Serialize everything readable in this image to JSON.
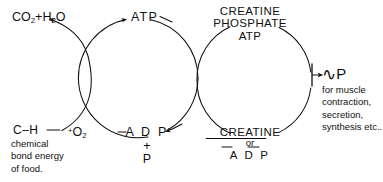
{
  "diagram": {
    "type": "hand-drawn cycle diagram",
    "ink_color": "#101010",
    "background_color": "#ffffff",
    "labels": {
      "waste_products": {
        "formula_1": "CO",
        "sub_1": "2",
        "plus": "+",
        "formula_2": "H",
        "sub_2": "2",
        "formula_3": "O"
      },
      "atp": "ATP",
      "creatine_phosphate_atp": {
        "line_1": "CREATINE",
        "line_2": "PHOSPHATE",
        "line_3": "ATP"
      },
      "high_energy_phosphate": {
        "squiggle": "∿",
        "symbol": "P"
      },
      "uses": {
        "line_1": "for muscle",
        "line_2": "contraction,",
        "line_3": "secretion,",
        "line_4": "synthesis etc.."
      },
      "food_bond": "C–H",
      "food_bond_caption": {
        "line_1": "chemical",
        "line_2": "bond energy",
        "line_3": "of food."
      },
      "oxygen": {
        "plus": "+",
        "element": "O",
        "sub": "2"
      },
      "adp_plus_p": {
        "line_1": "A D P",
        "line_2": "+",
        "line_3": "P"
      },
      "creatine_or_adp": {
        "line_1": "CREATINE",
        "line_2": "or",
        "line_3": "A D P"
      }
    },
    "cycles": [
      {
        "name": "atp-adp-cycle",
        "center_x": 138,
        "center_y": 78,
        "radius": 60
      },
      {
        "name": "creatine-phosphate-cycle",
        "center_x": 254,
        "center_y": 80,
        "radius": 57
      }
    ],
    "arrows": [
      {
        "name": "arrow-to-waste-products",
        "points_to": "CO2 + H2O"
      },
      {
        "name": "arrow-to-atp",
        "points_to": "ATP"
      },
      {
        "name": "arrow-to-adp",
        "points_to": "A D P + P"
      },
      {
        "name": "arrow-to-high-energy-phosphate",
        "points_to": "~P"
      }
    ]
  }
}
